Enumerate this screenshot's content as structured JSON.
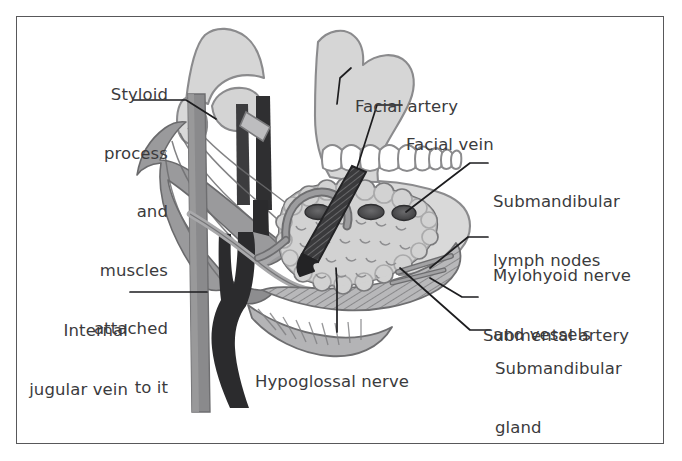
{
  "figure": {
    "kind": "anatomical-illustration",
    "region": "Submandibular triangle / floor of mouth",
    "border_color": "#58585a",
    "background_color": "#ffffff",
    "label_color": "#3b3b3d",
    "leader_color": "#1d1d1f"
  },
  "palette": {
    "bone_fill": "#d6d6d6",
    "bone_stroke": "#8b8b8d",
    "gland_fill": "#d2d2d2",
    "gland_stroke": "#6e6e70",
    "muscle_fill": "#9a9a9c",
    "muscle_stroke": "#6a6a6c",
    "mylohyoid_fill": "#b4b4b6",
    "vein_dark": "#2b2b2d",
    "jugular_gray": "#8a8a8c",
    "nerve_light": "#a9a9ab",
    "node_fill": "#4a4a4c",
    "tooth_fill": "#ffffff",
    "tooth_stroke": "#8b8b8d"
  },
  "labels": {
    "styloid": {
      "id": "styloid-process-and-muscles",
      "lines": [
        "Styloid",
        "process",
        "and",
        "muscles",
        "attached",
        "to it"
      ],
      "text": "Styloid process and muscles attached to it",
      "align": "right"
    },
    "internal_jugular": {
      "id": "internal-jugular-vein",
      "lines": [
        "Internal",
        "jugular vein"
      ],
      "text": "Internal jugular vein",
      "align": "right"
    },
    "facial_artery": {
      "id": "facial-artery",
      "lines": [
        "Facial artery"
      ],
      "text": "Facial artery",
      "align": "left"
    },
    "facial_vein": {
      "id": "facial-vein",
      "lines": [
        "Facial vein"
      ],
      "text": "Facial vein",
      "align": "left"
    },
    "lymph_nodes": {
      "id": "submandibular-lymph-nodes",
      "lines": [
        "Submandibular",
        "lymph nodes"
      ],
      "text": "Submandibular lymph nodes",
      "align": "left"
    },
    "mylohyoid": {
      "id": "mylohyoid-nerve-and-vessels",
      "lines": [
        "Mylohyoid nerve",
        "and vessels"
      ],
      "text": "Mylohyoid nerve and vessels",
      "align": "left"
    },
    "submental_artery": {
      "id": "submental-artery",
      "lines": [
        "Submental artery"
      ],
      "text": "Submental artery",
      "align": "left"
    },
    "submandibular_gland": {
      "id": "submandibular-gland",
      "lines": [
        "Submandibular",
        "gland"
      ],
      "text": "Submandibular gland",
      "align": "left"
    },
    "hypoglossal": {
      "id": "hypoglossal-nerve",
      "lines": [
        "Hypoglossal nerve"
      ],
      "text": "Hypoglossal nerve",
      "align": "left"
    }
  }
}
